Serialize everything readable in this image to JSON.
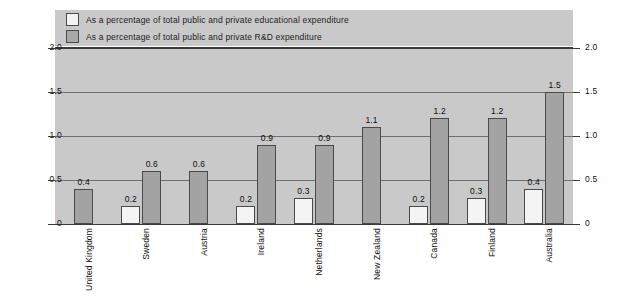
{
  "chart_data": {
    "type": "bar",
    "title": "",
    "subtitle": "",
    "xlabel": "",
    "ylabel": "",
    "ylim": [
      0,
      2.0
    ],
    "yticks": [
      "0",
      "0.5",
      "1.0",
      "1.5",
      "2.0"
    ],
    "ytick_values": [
      0,
      0.5,
      1.0,
      1.5,
      2.0
    ],
    "grid": true,
    "legend_position": "top-left",
    "dual_y_axis": true,
    "categories": [
      "United Kingdom",
      "Sweden",
      "Austria",
      "Ireland",
      "Netherlands",
      "New Zealand",
      "Canada",
      "Finland",
      "Australia"
    ],
    "series": [
      {
        "name": "As a percentage of total public and private educational expenditure",
        "key": "educational",
        "color": "#f4f4f4",
        "values": [
          null,
          0.2,
          null,
          0.2,
          0.3,
          null,
          0.2,
          0.3,
          0.4
        ],
        "labels": [
          "",
          "0.2",
          "",
          "0.2",
          "0.3",
          "",
          "0.2",
          "0.3",
          "0.4"
        ]
      },
      {
        "name": "As a percentage of total public and private R&D expenditure",
        "key": "rnd",
        "color": "#a3a3a3",
        "values": [
          0.4,
          0.6,
          0.6,
          0.9,
          0.9,
          1.1,
          1.2,
          1.2,
          1.5
        ],
        "labels": [
          "0.4",
          "0.6",
          "0.6",
          "0.9",
          "0.9",
          "1.1",
          "1.2",
          "1.2",
          "1.5"
        ]
      }
    ]
  },
  "legend": {
    "items": [
      {
        "label": "As a percentage of total public and private educational expenditure",
        "swatch": "light"
      },
      {
        "label": "As a percentage of total public and private R&D expenditure",
        "swatch": "dark"
      }
    ]
  },
  "axis": {
    "left_ticks": [
      "2.0",
      "1.5",
      "1.0",
      "0.5",
      "0"
    ],
    "right_ticks": [
      "2.0",
      "1.5",
      "1.0",
      "0.5",
      "0"
    ]
  },
  "colors": {
    "plot_background": "#c9c9c9",
    "page_background": "#ffffff",
    "bar_light": "#f4f4f4",
    "bar_dark": "#a3a3a3",
    "gridline": "#6f6f6f",
    "axis": "#3a3a3a",
    "text": "#111111"
  }
}
